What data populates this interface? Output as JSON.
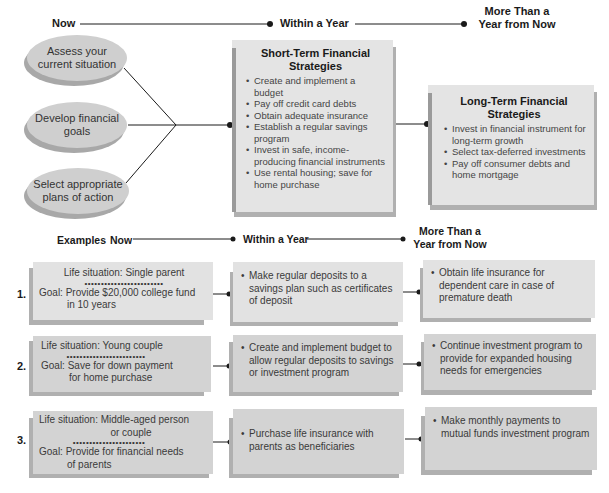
{
  "timeline_top": {
    "now": "Now",
    "within_year": "Within a Year",
    "more_than_year_line1": "More Than a",
    "more_than_year_line2": "Year from Now"
  },
  "process_steps": [
    {
      "line1": "Assess your",
      "line2": "current situation"
    },
    {
      "line1": "Develop financial",
      "line2": "goals"
    },
    {
      "line1": "Select appropriate",
      "line2": "plans of action"
    }
  ],
  "short_term": {
    "title_line1": "Short-Term Financial",
    "title_line2": "Strategies",
    "items": [
      "Create and implement a budget",
      "Pay off credit card debts",
      "Obtain adequate insurance",
      "Establish a regular savings program",
      "Invest in safe, income-producing financial instruments",
      "Use rental housing; save for home purchase"
    ]
  },
  "long_term": {
    "title_line1": "Long-Term Financial",
    "title_line2": "Strategies",
    "items": [
      "Invest in financial instrument for long-term growth",
      "Select tax-deferred investments",
      "Pay off consumer debts and home mortgage"
    ]
  },
  "timeline_examples": {
    "examples": "Examples",
    "now": "Now",
    "within_year": "Within a Year",
    "more_than_year_line1": "More Than a",
    "more_than_year_line2": "Year from Now"
  },
  "examples": [
    {
      "number": "1.",
      "life_situation": "Life situation: Single parent",
      "separator": "••••••••••••••••••••••••",
      "goal_line1": "Goal: Provide $20,000 college fund",
      "goal_line2": "in 10 years",
      "within_year": "Make regular deposits to a savings plan such as certificates of deposit",
      "long_term": "Obtain life insurance for dependent care in case of premature death"
    },
    {
      "number": "2.",
      "life_situation": "Life situation: Young couple",
      "separator": "••••••••••••••••••••••••",
      "goal_line1": "Goal: Save for down payment",
      "goal_line2": "for home purchase",
      "within_year": "Create and implement budget to allow regular deposits to savings or investment program",
      "long_term": "Continue investment program to provide for expanded housing needs for emergencies"
    },
    {
      "number": "3.",
      "life_situation_line1": "Life situation: Middle-aged person",
      "life_situation_line2": "or couple",
      "separator": "••••••••••••••••••••••",
      "goal_line1": "Goal: Provide for financial needs",
      "goal_line2": "of parents",
      "within_year": "Purchase life insurance with parents as beneficiaries",
      "long_term": "Make monthly payments to mutual funds investment program"
    }
  ],
  "colors": {
    "oval_fill": "#cfcfcf",
    "box_fill": "#e4e4e4",
    "box_shadow": "#b0b0b0",
    "line": "#1a1a1a"
  }
}
